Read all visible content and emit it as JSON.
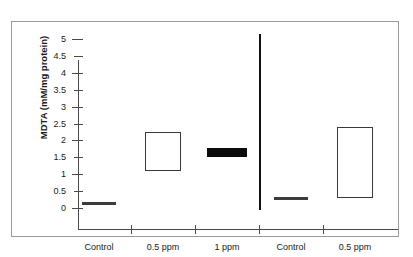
{
  "chart_data": {
    "type": "bar",
    "title": "",
    "subtitle": "",
    "xlabel": "",
    "ylabel": "MDTA (mM/mg protein)",
    "ylim": [
      0,
      5
    ],
    "ytick_labels": [
      "0",
      "0.5",
      "1",
      "1.5",
      "2",
      "2.5",
      "3",
      "3.5",
      "4",
      "4.5",
      "5"
    ],
    "ytick_values": [
      0,
      0.5,
      1,
      1.5,
      2,
      2.5,
      3,
      3.5,
      4,
      4.5,
      5
    ],
    "grid": false,
    "legend_position": "none",
    "categories": [
      "Control",
      "0.5 ppm",
      "1 ppm",
      "Control",
      "0.5 ppm"
    ],
    "values": [
      0.12,
      1.68,
      1.65,
      0.3,
      1.35
    ],
    "marks": [
      {
        "label": "Control",
        "group": 1,
        "style": "filled-thin",
        "low": 0.08,
        "high": 0.17,
        "value": 0.12
      },
      {
        "label": "0.5 ppm",
        "group": 1,
        "style": "open-box",
        "low": 1.1,
        "high": 2.25,
        "value": 1.68
      },
      {
        "label": "1 ppm",
        "group": 1,
        "style": "filled-thick",
        "low": 1.52,
        "high": 1.78,
        "value": 1.65
      },
      {
        "label": "Control",
        "group": 2,
        "style": "filled-thin",
        "low": 0.25,
        "high": 0.34,
        "value": 0.3
      },
      {
        "label": "0.5 ppm",
        "group": 2,
        "style": "open-box",
        "low": 0.3,
        "high": 2.4,
        "value": 1.35
      }
    ],
    "separator_after_category_index": 2,
    "colors": {
      "axis": "#4a4a4a",
      "filled_mark": "#3c3c3c",
      "filled_mark_thick": "#0b0b0b",
      "open_mark_border": "#3a3a3a",
      "separator": "#111111",
      "frame": "#9a9a9a",
      "background": "#ffffff",
      "text": "#1a1a1a"
    }
  },
  "axis": {
    "y_title": "MDTA (mM/mg protein)"
  }
}
